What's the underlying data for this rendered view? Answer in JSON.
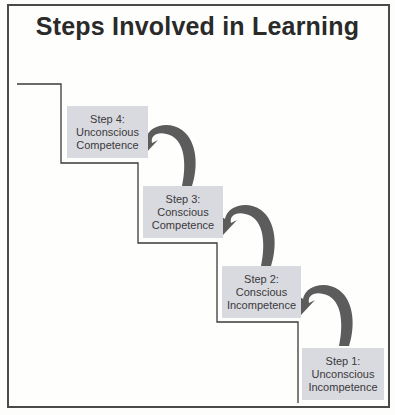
{
  "title": "Steps Involved in Learning",
  "colors": {
    "box_fill": "#d9d9e0",
    "arrow_fill": "#5c5c5c",
    "stair_line": "#3a3a3a",
    "frame_border": "#4a4a4a"
  },
  "steps": [
    {
      "label": "Step 4:",
      "line1": "Unconscious",
      "line2": "Competence"
    },
    {
      "label": "Step 3:",
      "line1": "Conscious",
      "line2": "Competence"
    },
    {
      "label": "Step 2:",
      "line1": "Conscious",
      "line2": "Incompetence"
    },
    {
      "label": "Step 1:",
      "line1": "Unconscious",
      "line2": "Incompetence"
    }
  ],
  "icons": {
    "arrows": [
      "curved-arrow-icon",
      "curved-arrow-icon",
      "curved-arrow-icon"
    ]
  }
}
